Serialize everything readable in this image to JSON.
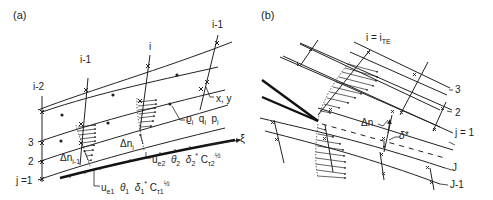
{
  "panels": [
    {
      "id": "a",
      "label": "(a)",
      "grid_column_labels": [
        "i-2",
        "i-1",
        "i",
        "i-1"
      ],
      "grid_row_labels": [
        "j =1",
        "2",
        "3"
      ],
      "point_label": "x, y",
      "cell_props_label": "ϱi  qi  pi",
      "axis_label": "ξ",
      "delta_n_labels": [
        "Δni-1",
        "Δni"
      ],
      "station1_label": "ue1  θ1  δ1*  Cτ1^½",
      "station2_label": "ue2  θ2  δ2*  Cτ2^½"
    },
    {
      "id": "b",
      "label": "(b)",
      "trailing_edge_label": "i = iTE",
      "upper_row_labels": [
        "3",
        "2",
        "j = 1"
      ],
      "lower_row_labels": [
        "J",
        "J-1"
      ],
      "delta_n_label": "Δn",
      "delta_star_label": "δ*"
    }
  ],
  "text": {
    "a_label": "(a)",
    "b_label": "(b)",
    "a_i2": "i-2",
    "a_i1_left": "i-1",
    "a_i": "i",
    "a_i1_right": "i-1",
    "a_j1": "j =1",
    "a_j2": "2",
    "a_j3": "3",
    "a_xy": "x, y",
    "a_rho": "ϱ",
    "a_q": "q",
    "a_p": "p",
    "a_sub_i": "i",
    "a_xi": "ξ",
    "a_dn": "Δn",
    "a_dn_sub1": "i-1",
    "a_dn_sub2": "i",
    "a_ue": "u",
    "a_e1": "e1",
    "a_e2": "e2",
    "a_theta1": "θ",
    "a_one": "1",
    "a_two": "2",
    "a_delta": "δ",
    "a_star": "*",
    "a_C": "C",
    "a_tau1": "τ1",
    "a_tau2": "τ2",
    "a_half": "½",
    "b_ite": "i = i",
    "b_te": "TE",
    "b_r3": "3",
    "b_r2": "2",
    "b_j1": "j = 1",
    "b_J": "J",
    "b_J1": "J-1",
    "b_dn": "Δn",
    "b_dstar": "δ*"
  }
}
